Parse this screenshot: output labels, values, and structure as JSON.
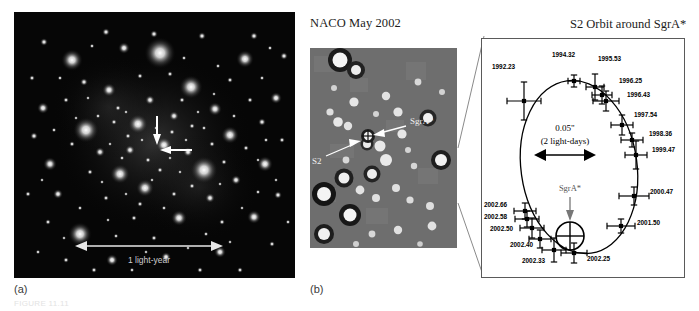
{
  "figure": {
    "panel_a": {
      "label": "(a)",
      "scalebar_label": "1 light-year",
      "center_marker": "crosshair-arrows"
    },
    "panel_b": {
      "label": "(b)",
      "title": "NACO May 2002",
      "annotations": [
        {
          "name": "sgra-star",
          "label": "SgrA*"
        },
        {
          "name": "s2-star",
          "label": "S2"
        }
      ]
    },
    "orbit_panel": {
      "title": "S2 Orbit around SgrA*",
      "scale_primary": "0.05\"",
      "scale_secondary": "(2 light-days)",
      "center_label": "SgrA*"
    },
    "caption": "FIGURE 11.11"
  },
  "chart_data": {
    "type": "scatter",
    "title": "S2 Orbit around SgrA*",
    "xlabel": "",
    "ylabel": "",
    "grid": false,
    "legend_position": "none",
    "annotations": [
      {
        "text": "0.05\"",
        "role": "scale-bar"
      },
      {
        "text": "(2 light-days)",
        "role": "scale-bar"
      },
      {
        "text": "SgrA*",
        "role": "central-mass-marker"
      }
    ],
    "series": [
      {
        "name": "S2 astrometric positions",
        "points": [
          {
            "epoch": "1992.23",
            "x": 42,
            "y": 62,
            "xerr": 17,
            "yerr": 19,
            "label_x": 10,
            "label_y": 30
          },
          {
            "epoch": "1994.32",
            "x": 92,
            "y": 42,
            "xerr": 6,
            "yerr": 6,
            "label_x": 70,
            "label_y": 18
          },
          {
            "epoch": "1995.53",
            "x": 113,
            "y": 48,
            "xerr": 9,
            "yerr": 13,
            "label_x": 116,
            "label_y": 22
          },
          {
            "epoch": "1996.25",
            "x": 120,
            "y": 56,
            "xerr": 10,
            "yerr": 9,
            "label_x": 137,
            "label_y": 44
          },
          {
            "epoch": "1996.43",
            "x": 124,
            "y": 62,
            "xerr": 13,
            "yerr": 10,
            "label_x": 145,
            "label_y": 58
          },
          {
            "epoch": "1997.54",
            "x": 140,
            "y": 86,
            "xerr": 11,
            "yerr": 10,
            "label_x": 152,
            "label_y": 78
          },
          {
            "epoch": "1998.36",
            "x": 150,
            "y": 101,
            "xerr": 11,
            "yerr": 7,
            "label_x": 167,
            "label_y": 97
          },
          {
            "epoch": "1999.47",
            "x": 154,
            "y": 116,
            "xerr": 11,
            "yerr": 14,
            "label_x": 170,
            "label_y": 113
          },
          {
            "epoch": "2000.47",
            "x": 152,
            "y": 157,
            "xerr": 15,
            "yerr": 9,
            "label_x": 168,
            "label_y": 155
          },
          {
            "epoch": "2001.50",
            "x": 139,
            "y": 187,
            "xerr": 14,
            "yerr": 7,
            "label_x": 155,
            "label_y": 186
          },
          {
            "epoch": "2002.25",
            "x": 92,
            "y": 214,
            "xerr": 13,
            "yerr": 10,
            "label_x": 105,
            "label_y": 222
          },
          {
            "epoch": "2002.33",
            "x": 72,
            "y": 211,
            "xerr": 12,
            "yerr": 12,
            "label_x": 40,
            "label_y": 224
          },
          {
            "epoch": "2002.40",
            "x": 58,
            "y": 200,
            "xerr": 11,
            "yerr": 9,
            "label_x": 28,
            "label_y": 208
          },
          {
            "epoch": "2002.50",
            "x": 50,
            "y": 189,
            "xerr": 12,
            "yerr": 10,
            "label_x": 8,
            "label_y": 192
          },
          {
            "epoch": "2002.58",
            "x": 45,
            "y": 180,
            "xerr": 12,
            "yerr": 8,
            "label_x": 2,
            "label_y": 180
          },
          {
            "epoch": "2002.66",
            "x": 43,
            "y": 172,
            "xerr": 11,
            "yerr": 8,
            "label_x": 2,
            "label_y": 168
          }
        ]
      }
    ],
    "orbit_fit": {
      "name": "best-fit Keplerian ellipse",
      "cx": 97,
      "cy": 128,
      "rx": 58,
      "ry": 87,
      "rotation": -8
    },
    "focus_marker": {
      "name": "SgrA*",
      "x": 88,
      "y": 197,
      "r": 14
    }
  }
}
